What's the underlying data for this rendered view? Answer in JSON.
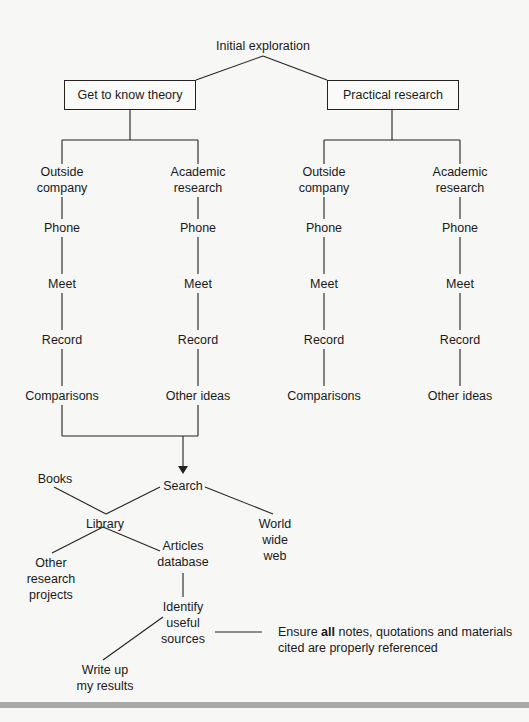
{
  "diagram": {
    "root": "Initial exploration",
    "branches": [
      {
        "label": "Get to know theory",
        "columns": [
          {
            "head": [
              "Outside",
              "company"
            ],
            "steps": [
              "Phone",
              "Meet",
              "Record",
              "Comparisons"
            ]
          },
          {
            "head": [
              "Academic",
              "research"
            ],
            "steps": [
              "Phone",
              "Meet",
              "Record",
              "Other ideas"
            ]
          }
        ]
      },
      {
        "label": "Practical research",
        "columns": [
          {
            "head": [
              "Outside",
              "company"
            ],
            "steps": [
              "Phone",
              "Meet",
              "Record",
              "Comparisons"
            ]
          },
          {
            "head": [
              "Academic",
              "research"
            ],
            "steps": [
              "Phone",
              "Meet",
              "Record",
              "Other ideas"
            ]
          }
        ]
      }
    ],
    "search": {
      "label": "Search",
      "books": "Books",
      "library": "Library",
      "www": [
        "World",
        "wide",
        "web"
      ],
      "other_projects": [
        "Other",
        "research",
        "projects"
      ],
      "articles": [
        "Articles",
        "database"
      ],
      "identify": [
        "Identify",
        "useful",
        "sources"
      ],
      "write_up": [
        "Write up",
        "my results"
      ],
      "note_prefix": "Ensure ",
      "note_bold": "all",
      "note_line1_rest": " notes, quotations and materials",
      "note_line2": "cited are properly referenced"
    }
  }
}
